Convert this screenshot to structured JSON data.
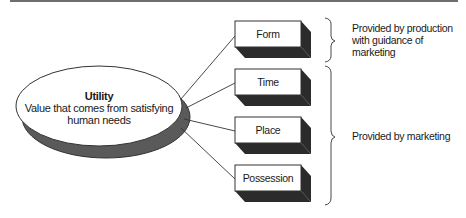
{
  "diagram": {
    "center": {
      "title": "Utility",
      "description_line1": "Value that comes from satisfying",
      "description_line2": "human needs"
    },
    "boxes": [
      {
        "label": "Form"
      },
      {
        "label": "Time"
      },
      {
        "label": "Place"
      },
      {
        "label": "Possession"
      }
    ],
    "groups": [
      {
        "line1": "Provided by production",
        "line2": "with guidance of marketing",
        "covers": [
          "Form"
        ]
      },
      {
        "line1": "Provided by marketing",
        "covers": [
          "Time",
          "Place",
          "Possession"
        ]
      }
    ],
    "colors": {
      "shadow": "#5a5a5a",
      "box_shadow": "#2b2b2b",
      "stroke": "#333333",
      "rule": "#6e6e6e"
    }
  }
}
